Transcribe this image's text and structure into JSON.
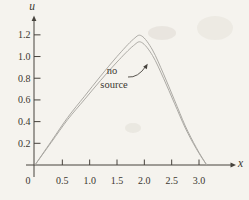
{
  "figure": {
    "background_color": "#f5f3ee",
    "axis_color": "#46423c",
    "curve_color": "#a8a5a0",
    "text_color": "#3b372f",
    "y_axis_label": "u",
    "x_axis_label": "x",
    "origin_label": "0",
    "annotation_line1": "no",
    "annotation_line2": "source"
  },
  "chart_data": {
    "type": "line",
    "title": "",
    "xlabel": "x",
    "ylabel": "u",
    "xlim": [
      0,
      3.6
    ],
    "ylim": [
      0,
      1.35
    ],
    "grid": false,
    "legend": "none",
    "x_ticks": [
      0.5,
      1.0,
      1.5,
      2.0,
      2.5,
      3.0
    ],
    "x_tick_labels": [
      "0.5",
      "1.0",
      "1.5",
      "2.0",
      "2.5",
      "3.0"
    ],
    "y_ticks": [
      0.2,
      0.4,
      0.6,
      0.8,
      1.0,
      1.2
    ],
    "y_tick_labels": [
      "0.2",
      "0.4",
      "0.6",
      "0.8",
      "1.0",
      "1.2"
    ],
    "annotation": "no source",
    "series": [
      {
        "name": "no source - upper curve",
        "points": [
          [
            0,
            0
          ],
          [
            0.3,
            0.22
          ],
          [
            0.6,
            0.44
          ],
          [
            0.9,
            0.63
          ],
          [
            1.2,
            0.82
          ],
          [
            1.5,
            1.0
          ],
          [
            1.8,
            1.16
          ],
          [
            1.95,
            1.19
          ],
          [
            2.15,
            1.06
          ],
          [
            2.35,
            0.84
          ],
          [
            2.55,
            0.6
          ],
          [
            2.75,
            0.36
          ],
          [
            2.95,
            0.16
          ],
          [
            3.14,
            0
          ]
        ]
      },
      {
        "name": "no source - lower curve",
        "points": [
          [
            0,
            0
          ],
          [
            0.3,
            0.21
          ],
          [
            0.6,
            0.42
          ],
          [
            0.9,
            0.6
          ],
          [
            1.2,
            0.78
          ],
          [
            1.5,
            0.95
          ],
          [
            1.8,
            1.1
          ],
          [
            1.95,
            1.13
          ],
          [
            2.15,
            1.01
          ],
          [
            2.35,
            0.8
          ],
          [
            2.55,
            0.57
          ],
          [
            2.75,
            0.34
          ],
          [
            2.95,
            0.15
          ],
          [
            3.14,
            0
          ]
        ]
      }
    ]
  }
}
